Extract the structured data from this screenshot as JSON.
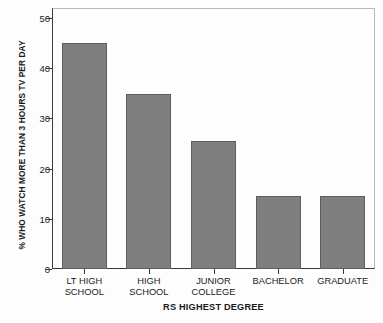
{
  "chart_data": {
    "type": "bar",
    "title": "",
    "xlabel": "RS HIGHEST DEGREE",
    "ylabel": "% WHO WATCH MORE THAN 3 HOURS TV PER DAY",
    "categories": [
      "LT HIGH SCHOOL",
      "HIGH SCHOOL",
      "JUNIOR COLLEGE",
      "BACHELOR",
      "GRADUATE"
    ],
    "category_lines": [
      [
        "LT HIGH",
        "SCHOOL"
      ],
      [
        "HIGH",
        "SCHOOL"
      ],
      [
        "JUNIOR",
        "COLLEGE"
      ],
      [
        "BACHELOR"
      ],
      [
        "GRADUATE"
      ]
    ],
    "values": [
      45.0,
      34.8,
      25.5,
      14.6,
      14.6
    ],
    "ylim": [
      0,
      52
    ],
    "yticks": [
      0,
      10,
      20,
      30,
      40,
      50
    ],
    "ytick_labels": [
      "0",
      "10",
      "20",
      "30",
      "40",
      "50"
    ],
    "grid": false,
    "legend": false,
    "bar_color": "#7f7f7f",
    "bar_edge_color": "#5e5e5e",
    "axis_color": "#3a3a3a",
    "frame_color": "#b9b9b9",
    "background_color": "#fdfdfd"
  }
}
